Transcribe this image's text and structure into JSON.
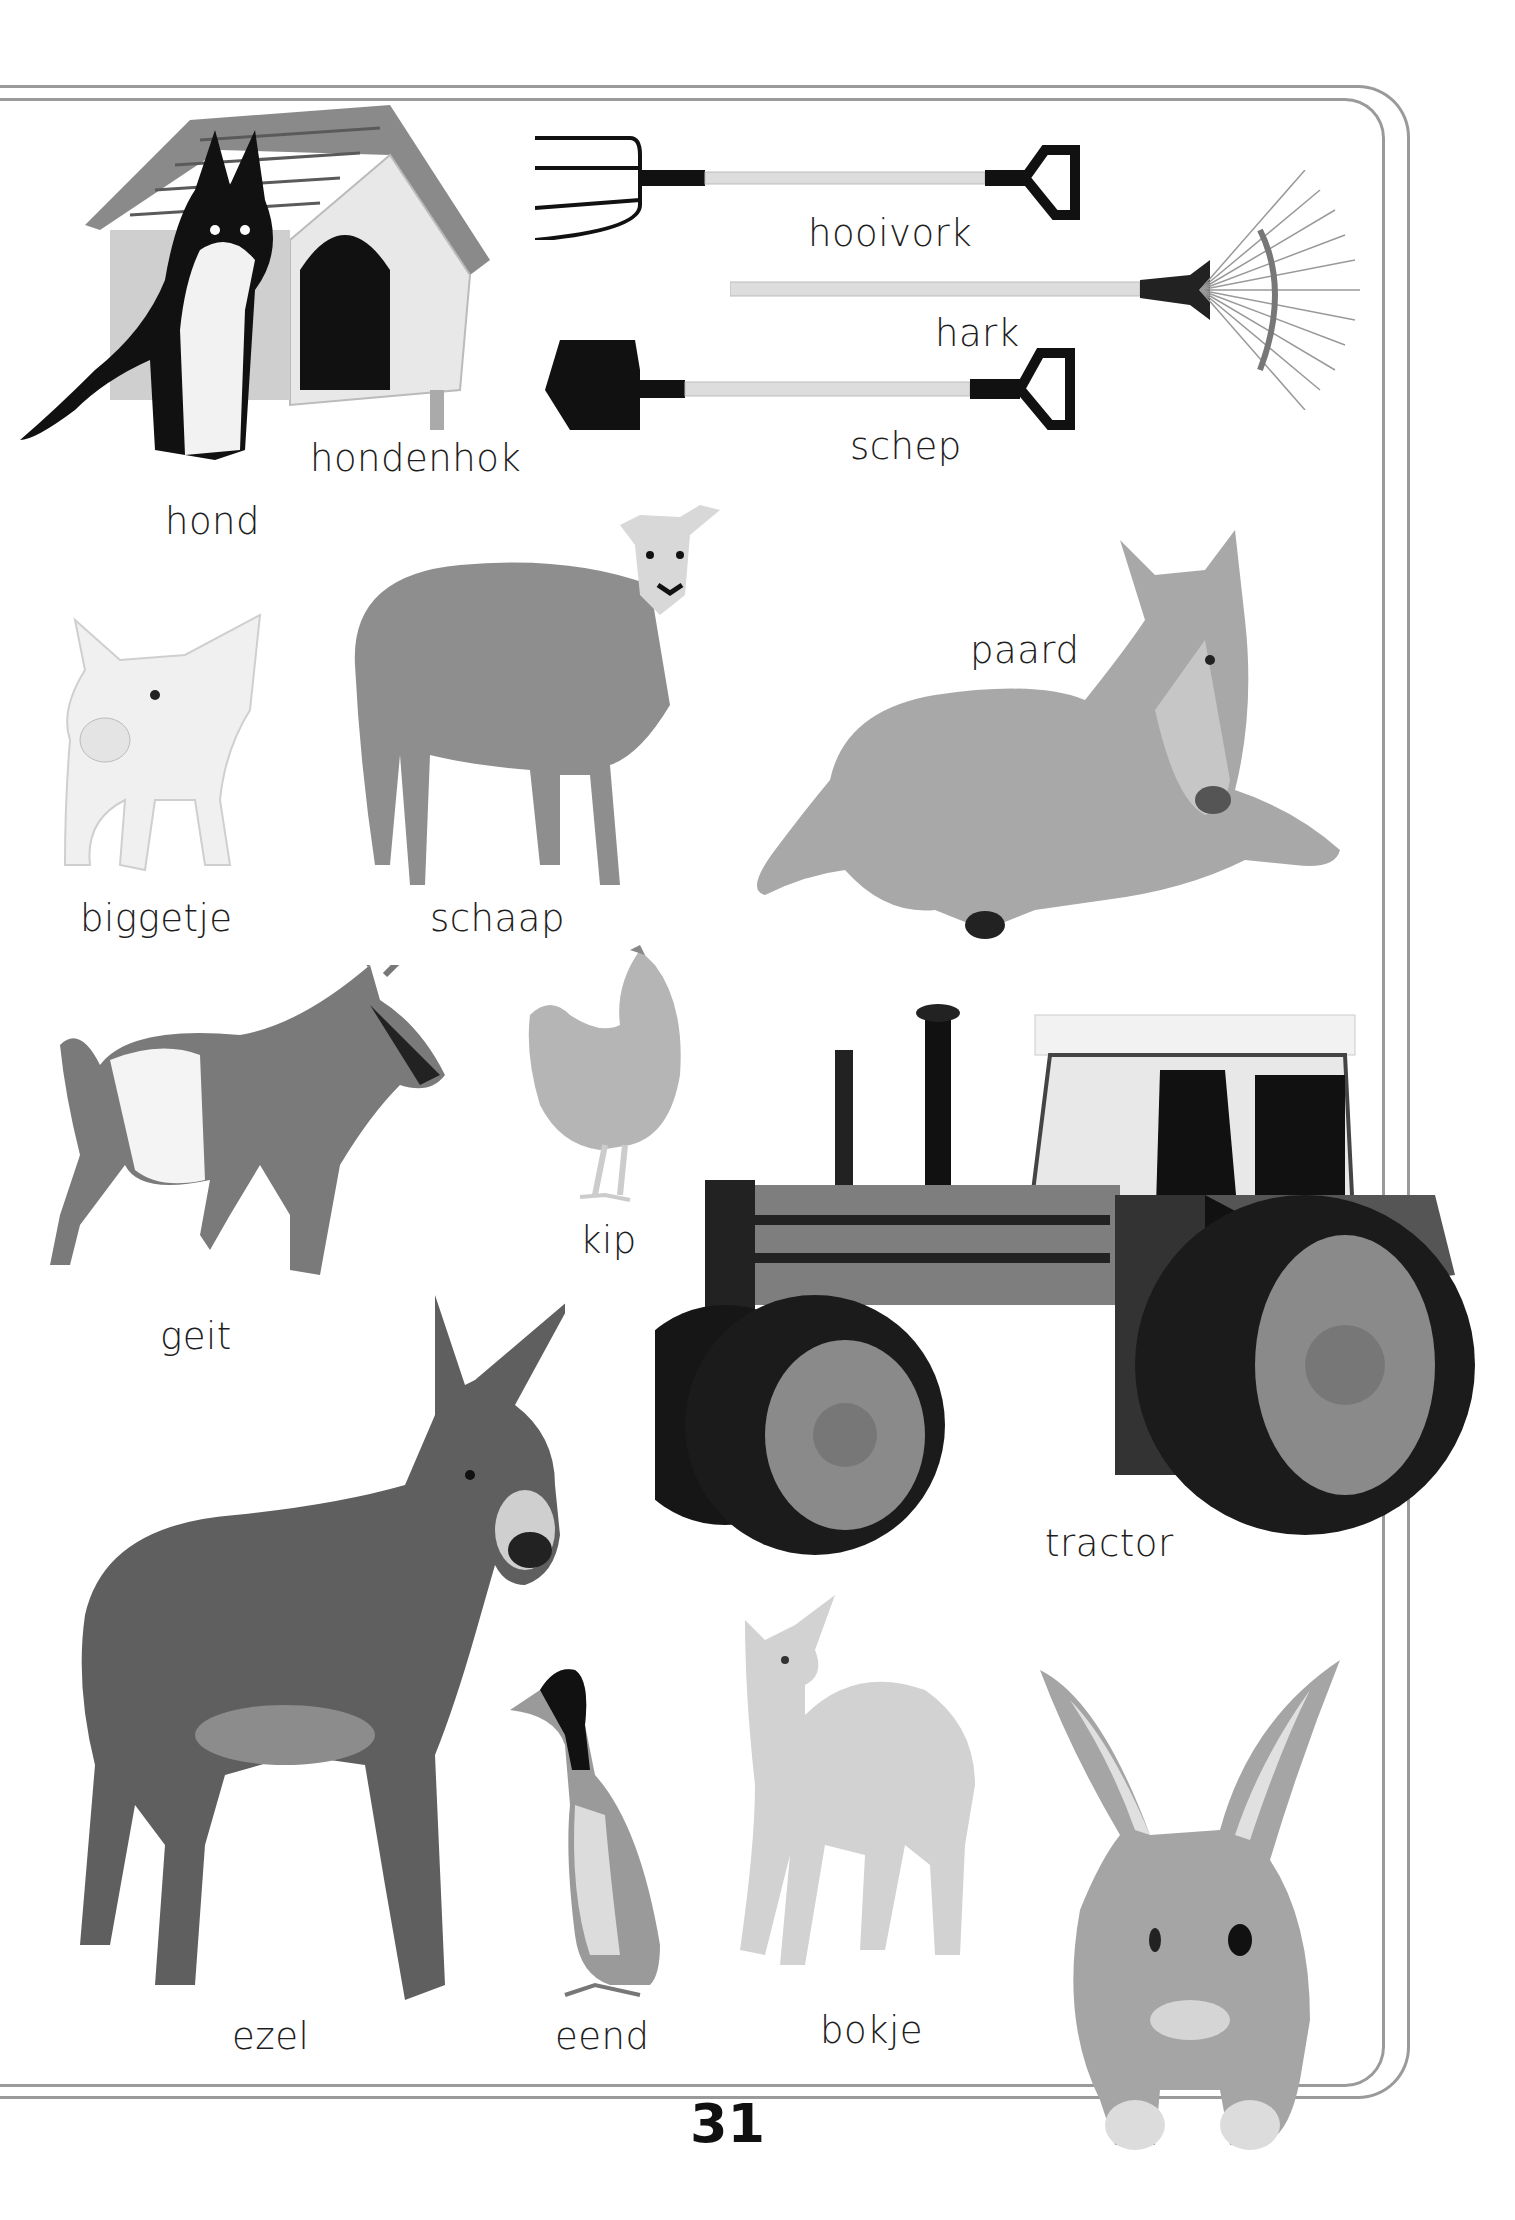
{
  "page": {
    "number": "31",
    "background": "#ffffff",
    "border_color": "#9a9a9a",
    "text_color": "#1e1e1e"
  },
  "items": [
    {
      "id": "hondenhok",
      "label": "hondenhok",
      "icon": "doghouse-picture"
    },
    {
      "id": "hond",
      "label": "hond",
      "icon": "dog-picture"
    },
    {
      "id": "hooivork",
      "label": "hooivork",
      "icon": "pitchfork-picture"
    },
    {
      "id": "hark",
      "label": "hark",
      "icon": "rake-picture"
    },
    {
      "id": "schep",
      "label": "schep",
      "icon": "shovel-picture"
    },
    {
      "id": "biggetje",
      "label": "biggetje",
      "icon": "piglet-picture"
    },
    {
      "id": "schaap",
      "label": "schaap",
      "icon": "sheep-picture"
    },
    {
      "id": "paard",
      "label": "paard",
      "icon": "foal-picture"
    },
    {
      "id": "geit",
      "label": "geit",
      "icon": "goat-picture"
    },
    {
      "id": "kip",
      "label": "kip",
      "icon": "chicken-picture"
    },
    {
      "id": "tractor",
      "label": "tractor",
      "icon": "tractor-picture"
    },
    {
      "id": "ezel",
      "label": "ezel",
      "icon": "donkey-picture"
    },
    {
      "id": "eend",
      "label": "eend",
      "icon": "duck-picture"
    },
    {
      "id": "bokje",
      "label": "bokje",
      "icon": "kid-goat-picture"
    },
    {
      "id": "konijn",
      "label": "",
      "icon": "rabbit-picture"
    }
  ]
}
